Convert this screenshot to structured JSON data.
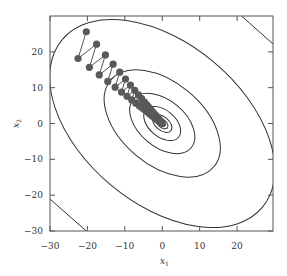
{
  "chart_data": {
    "type": "scatter",
    "subtype": "contour-with-optimization-trajectory",
    "title": "",
    "xlabel": "x1",
    "ylabel": "x2",
    "xlim": [
      -30,
      29.6
    ],
    "ylim": [
      -30,
      30
    ],
    "xticks": [
      -30,
      -20,
      -10,
      0,
      10,
      20
    ],
    "yticks": [
      -30,
      -20,
      -10,
      0,
      10,
      20
    ],
    "xtick_labels": [
      "−30",
      "−20",
      "−10",
      "0",
      "10",
      "20"
    ],
    "ytick_labels": [
      "−30",
      "−20",
      "−10",
      "0",
      "10",
      "20"
    ],
    "grid": false,
    "legend": null,
    "contours": {
      "center": [
        0,
        0
      ],
      "rotation_deg": 40,
      "shape": "ellipse",
      "semi_axes_data_units": [
        [
          34.9,
          22.4
        ],
        [
          18.0,
          11.5
        ],
        [
          10.1,
          6.5
        ],
        [
          5.7,
          3.7
        ],
        [
          3.0,
          1.9
        ],
        [
          1.8,
          1.1
        ],
        [
          0.95,
          0.6
        ]
      ],
      "clipped_corner_segments": [
        {
          "corner": "top-right",
          "from": [
            21.2,
            30
          ],
          "to": [
            29.6,
            22.2
          ]
        },
        {
          "corner": "bottom-left",
          "from": [
            -30,
            -21.1
          ],
          "to": [
            -20.3,
            -30
          ]
        }
      ]
    },
    "trajectory": {
      "description": "Zig-zagging gradient-descent iterates converging to the minimum at (0,0)",
      "start": [
        -20.3,
        25.6
      ],
      "second": [
        -24.2,
        19.5
      ],
      "decay_ratio": 0.93,
      "num_points": 60,
      "end": [
        0,
        0
      ],
      "marker": "filled circle",
      "marker_color": "#555555",
      "line_color": "#555555"
    }
  },
  "colors": {
    "contour": "#333333",
    "axes": "#555555",
    "marker": "#595959"
  }
}
